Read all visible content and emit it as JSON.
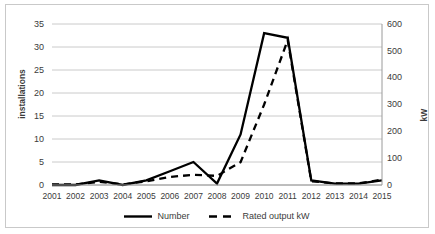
{
  "chart_data": {
    "type": "line",
    "title": "",
    "xlabel": "",
    "ylabel": "installations",
    "y2label": "kW",
    "categories": [
      "2001",
      "2002",
      "2003",
      "2004",
      "2005",
      "2006",
      "2007",
      "2008",
      "2009",
      "2010",
      "2011",
      "2012",
      "2013",
      "2014",
      "2015"
    ],
    "ylim": [
      0,
      35
    ],
    "y2lim": [
      0,
      600
    ],
    "yticks": [
      0,
      5,
      10,
      15,
      20,
      25,
      30,
      35
    ],
    "y2ticks": [
      0,
      100,
      200,
      300,
      400,
      500,
      600
    ],
    "grid": true,
    "legend_position": "bottom",
    "series": [
      {
        "name": "Number",
        "axis": "left",
        "style": "solid",
        "color": "#000000",
        "values": [
          0,
          0,
          1,
          0,
          1,
          3,
          5,
          0.3,
          11,
          33,
          32,
          1,
          0.3,
          0.3,
          1
        ]
      },
      {
        "name": "Rated output kW",
        "axis": "right",
        "style": "dashed",
        "color": "#000000",
        "values": [
          2,
          2,
          12,
          2,
          14,
          30,
          38,
          34,
          85,
          300,
          540,
          14,
          6,
          6,
          20
        ]
      }
    ]
  },
  "axis": {
    "left_title": "installations",
    "right_title": "kW",
    "left_ticks": [
      "35",
      "30",
      "25",
      "20",
      "15",
      "10",
      "5",
      "0"
    ],
    "right_ticks": [
      "600",
      "500",
      "400",
      "300",
      "200",
      "100",
      "0"
    ],
    "x_ticks": [
      "2001",
      "2002",
      "2003",
      "2004",
      "2005",
      "2006",
      "2007",
      "2008",
      "2009",
      "2010",
      "2011",
      "2012",
      "2013",
      "2014",
      "2015"
    ]
  },
  "legend": {
    "items": [
      {
        "label": "Number",
        "style": "solid"
      },
      {
        "label": "Rated output kW",
        "style": "dashed"
      }
    ]
  },
  "colors": {
    "series": "#000000",
    "grid": "#c4c4c4",
    "frame": "#c9c9c9",
    "text": "#3b3b3b"
  }
}
